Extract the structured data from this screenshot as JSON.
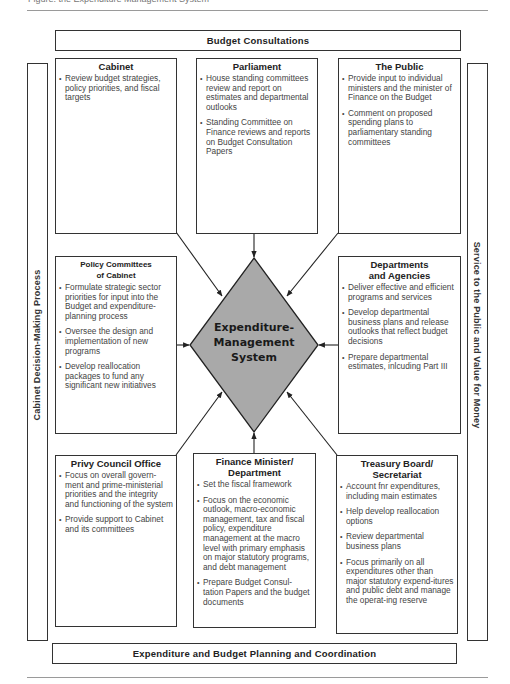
{
  "caption": "Figure: the Expenditure Management System",
  "top_band": {
    "label": "Budget Consultations"
  },
  "bottom_band": {
    "label": "Expenditure and Budget Planning and Coordination"
  },
  "left_bar": {
    "label": "Cabinet Decision-Making Process"
  },
  "right_bar": {
    "label": "Service to the Public and Value for Money"
  },
  "center": {
    "label_lines": [
      "Expenditure-",
      "Management",
      "System"
    ],
    "fill": "#a9a9a9"
  },
  "boxes": {
    "cabinet": {
      "title": "Cabinet",
      "items": [
        "Review budget strategies, policy priorities, and fiscal targets"
      ]
    },
    "parliament": {
      "title": "Parliament",
      "items": [
        "House standing committees review and report on estimates and departmental outlooks",
        "Standing Committee on Finance reviews and reports on Budget Consultation Papers"
      ]
    },
    "public": {
      "title": "The Public",
      "items": [
        "Provide input to individual ministers and the minister of Finance on the Budget",
        "Comment on proposed spending plans to parliamentary standing committees"
      ]
    },
    "policy_committees": {
      "title_line1": "Policy Committees",
      "title_line2": "of Cabinet",
      "items": [
        "Formulate strategic sector priorities for input into the Budget and expenditure-planning process",
        "Oversee the design and implementation of new programs",
        "Develop reallocation packages to fund any significant new initiatives"
      ]
    },
    "departments": {
      "title_line1": "Departments",
      "title_line2": "and Agencies",
      "items": [
        "Deliver effective and efficient programs and services",
        "Develop departmental business plans and release outlooks that reflect budget decisions",
        "Prepare departmental estimates, inlcuding Part III"
      ]
    },
    "privy_council": {
      "title": "Privy Council Office",
      "items": [
        "Focus on overall govern-ment and prime-ministerial priorities and the integrity and functioning of the system",
        "Provide support to Cabinet and its committees"
      ]
    },
    "finance": {
      "title_line1": "Finance Minister/",
      "title_line2": "Department",
      "items": [
        "Set the fiscal framework",
        "Focus on the economic outlook, macro-economic management, tax and fiscal policy, expenditure management at the macro level with primary emphasis on major statutory programs, and debt management",
        "Prepare Budget Consul-tation Papers and the budget documents"
      ]
    },
    "treasury": {
      "title_line1": "Treasury Board/",
      "title_line2": "Secretariat",
      "items": [
        "Account fnr expenditures, including main estimates",
        "Help develop reallocation options",
        "Review departmental business plans",
        "Focus primarily on all expenditures other than major statutory expend-itures and public debt and manage the operat-ing reserve"
      ]
    }
  }
}
